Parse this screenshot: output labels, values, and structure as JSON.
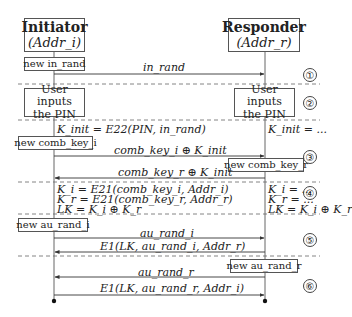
{
  "actors": {
    "initiator": {
      "title": "Initiator",
      "addr": "(Addr_i)"
    },
    "responder": {
      "title": "Responder",
      "addr": "(Addr_r)"
    }
  },
  "phases": [
    {
      "number": "1",
      "symbol": "①"
    },
    {
      "number": "2",
      "symbol": "②"
    },
    {
      "number": "3",
      "symbol": "③"
    },
    {
      "number": "4",
      "symbol": "④"
    },
    {
      "number": "5",
      "symbol": "⑤"
    },
    {
      "number": "6",
      "symbol": "⑥"
    }
  ],
  "boxes": {
    "new_in_rand": "new in_rand",
    "user_pin_initiator": "User inputs the PIN",
    "user_pin_responder": "User inputs the PIN",
    "new_comb_key_i": "new comb_key_i",
    "new_comb_key_r": "new comb_key_r",
    "new_au_rand_i": "new au_rand_i",
    "new_au_rand_r": "new au_rand_r"
  },
  "messages": [
    {
      "label": "in_rand",
      "direction": "initiator-to-responder"
    },
    {
      "label": "comb_key_i ⊕ K_init",
      "direction": "initiator-to-responder"
    },
    {
      "label": "comb_key_r ⊕ K_init",
      "direction": "responder-to-initiator"
    },
    {
      "label": "au_rand_i",
      "direction": "initiator-to-responder"
    },
    {
      "label": "E1(LK, au_rand_i, Addr_r)",
      "direction": "responder-to-initiator"
    },
    {
      "label": "au_rand_r",
      "direction": "responder-to-initiator"
    },
    {
      "label": "E1(LK, au_rand_r, Addr_i)",
      "direction": "initiator-to-responder"
    }
  ],
  "computations": {
    "kinit_initiator": "K_init = E22(PIN, in_rand)",
    "kinit_responder": "K_init = ...",
    "keys_initiator": [
      "K_i = E21(comb_key_i, Addr_i)",
      "K_r = E21(comb_key_r, Addr_r)",
      "LK = K_i ⊕ K_r"
    ],
    "keys_responder": [
      "K_i = ...",
      "K_r = ...",
      "LK = K_i ⊕ K_r"
    ]
  }
}
